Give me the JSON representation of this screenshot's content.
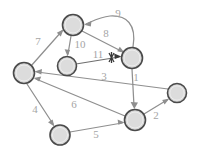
{
  "figure": {
    "kind": "directed-graph",
    "background_color": "#ffffff",
    "node_fill_color": "#d6d6d6",
    "node_stroke_color": "#4a4a4a",
    "edge_color": "#8f8f8f",
    "label_color": "#a5a5a5",
    "cross_mark_color": "#3a3a3a"
  },
  "nodes": [
    {
      "id": "n-top",
      "cx": 73,
      "cy": 25,
      "r": 10.5
    },
    {
      "id": "n-mid-left",
      "cx": 67,
      "cy": 66,
      "r": 9.5
    },
    {
      "id": "n-upper-right",
      "cx": 132,
      "cy": 58,
      "r": 10.5
    },
    {
      "id": "n-left",
      "cx": 24,
      "cy": 73,
      "r": 10.5
    },
    {
      "id": "n-bottom-left",
      "cx": 60,
      "cy": 135,
      "r": 10.0
    },
    {
      "id": "n-bottom-mid",
      "cx": 135,
      "cy": 120,
      "r": 10.5
    },
    {
      "id": "n-far-right",
      "cx": 177,
      "cy": 93,
      "r": 9.5
    }
  ],
  "edges": [
    {
      "label": "9",
      "from": "n-upper-right",
      "to": "n-top",
      "label_x": 118,
      "label_y": 14,
      "curved": true
    },
    {
      "label": "8",
      "from": "n-top",
      "to": "n-upper-right",
      "label_x": 106,
      "label_y": 34,
      "curved": false
    },
    {
      "label": "10",
      "from": "n-top",
      "to": "n-mid-left",
      "label_x": 80,
      "label_y": 45,
      "curved": false
    },
    {
      "label": "11",
      "from": "n-mid-left",
      "to": "n-upper-right",
      "label_x": 98,
      "label_y": 55,
      "curved": false
    },
    {
      "label": "7",
      "from": "n-left",
      "to": "n-top",
      "label_x": 38,
      "label_y": 42,
      "curved": false
    },
    {
      "label": "3",
      "from": "n-far-right",
      "to": "n-left",
      "label_x": 104,
      "label_y": 77,
      "curved": false
    },
    {
      "label": "1",
      "from": "n-upper-right",
      "to": "n-bottom-mid",
      "label_x": 136,
      "label_y": 78,
      "curved": false
    },
    {
      "label": "6",
      "from": "n-bottom-mid",
      "to": "n-left",
      "label_x": 74,
      "label_y": 105,
      "curved": false
    },
    {
      "label": "4",
      "from": "n-left",
      "to": "n-bottom-left",
      "label_x": 35,
      "label_y": 110,
      "curved": false
    },
    {
      "label": "5",
      "from": "n-bottom-left",
      "to": "n-bottom-mid",
      "label_x": 96,
      "label_y": 135,
      "curved": false
    },
    {
      "label": "2",
      "from": "n-bottom-mid",
      "to": "n-far-right",
      "label_x": 156,
      "label_y": 116,
      "curved": false
    }
  ],
  "labels": {
    "e1": "1",
    "e2": "2",
    "e3": "3",
    "e4": "4",
    "e5": "5",
    "e6": "6",
    "e7": "7",
    "e8": "8",
    "e9": "9",
    "e10": "10",
    "e11": "11"
  },
  "annotations": {
    "cross_mark": {
      "x": 112,
      "y": 57,
      "name": "edge-cut-cross-mark"
    }
  }
}
